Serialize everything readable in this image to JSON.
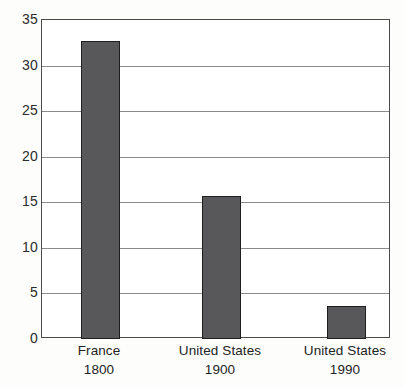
{
  "chart_data": {
    "type": "bar",
    "title": "",
    "subtitle": "",
    "xlabel": "",
    "ylabel": "",
    "categories": [
      "France",
      "United States",
      "United States"
    ],
    "category_sublabels": [
      "1800",
      "1900",
      "1990"
    ],
    "values": [
      32.7,
      15.7,
      3.6
    ],
    "series": [
      {
        "name": "",
        "values": [
          32.7,
          15.7,
          3.6
        ]
      }
    ],
    "ylim": [
      0,
      35
    ],
    "xlim": [
      0,
      3
    ],
    "ytick_labels": [
      "0",
      "5",
      "10",
      "15",
      "20",
      "25",
      "30",
      "35"
    ],
    "ytick_values": [
      0,
      5,
      10,
      15,
      20,
      25,
      30,
      35
    ],
    "xtick_labels": [],
    "grid": "horizontal",
    "legend": "none",
    "legend_entries": [],
    "annotations": [],
    "colors": {
      "bar_fill": "#58585a",
      "bar_outline": "#1e1e1e",
      "gridline": "#8a8a8a",
      "axis_frame": "#4a4a4a",
      "plot_background": "#ffffff",
      "page_background": "#fdfdfb",
      "text": "#232323"
    }
  }
}
